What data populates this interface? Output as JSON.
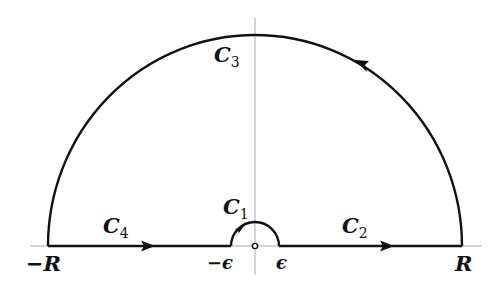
{
  "diagram": {
    "title": "",
    "type": "contour-integration-keyhole-semicircle",
    "colors": {
      "contour": "#111111",
      "axis": "#aaaaaa",
      "background": "#ffffff"
    },
    "labels": {
      "c1": {
        "main": "C",
        "sub": "1"
      },
      "c2": {
        "main": "C",
        "sub": "2"
      },
      "c3": {
        "main": "C",
        "sub": "3"
      },
      "c4": {
        "main": "C",
        "sub": "4"
      },
      "neg_r": "−R",
      "pos_r": "R",
      "neg_eps": "−ϵ",
      "pos_eps": "ϵ"
    },
    "segments": [
      {
        "id": "C4",
        "description": "real axis from -R to -epsilon",
        "direction": "right"
      },
      {
        "id": "C1",
        "description": "small semicircle of radius epsilon around origin",
        "direction": "clockwise (left to right over top)"
      },
      {
        "id": "C2",
        "description": "real axis from epsilon to R",
        "direction": "right"
      },
      {
        "id": "C3",
        "description": "large semicircle of radius R",
        "direction": "counterclockwise"
      }
    ]
  }
}
